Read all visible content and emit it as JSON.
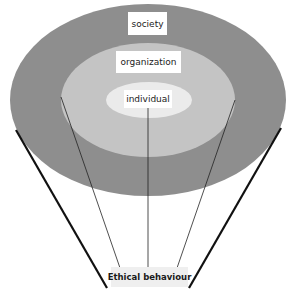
{
  "diagram": {
    "type": "nested-ellipses-funnel",
    "layers": [
      {
        "id": "outer",
        "label": "society",
        "color": "#8e8e8e",
        "cx": 148,
        "cy": 100,
        "rx": 138,
        "ry": 96
      },
      {
        "id": "middle",
        "label": "organization",
        "color": "#c4c4c4",
        "cx": 148,
        "cy": 100,
        "rx": 87,
        "ry": 57
      },
      {
        "id": "inner",
        "label": "individual",
        "color": "#ebebeb",
        "cx": 149,
        "cy": 100,
        "rx": 43,
        "ry": 18
      }
    ],
    "outcome": {
      "label": "Ethical behaviour",
      "background": "#efefef"
    },
    "connector_color": "#111111"
  }
}
